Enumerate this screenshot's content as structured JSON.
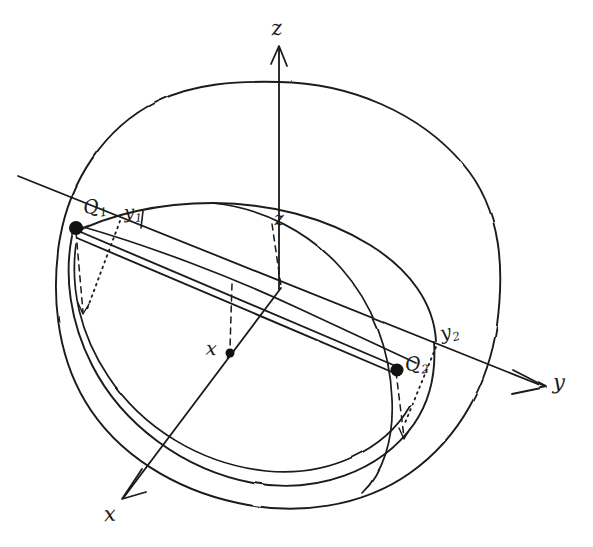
{
  "figure": {
    "kind": "hand-drawn-3d-sphere-diagram",
    "background_color": "#ffffff",
    "ink_color": "#1a1a1a"
  },
  "axes": [
    {
      "id": "z",
      "label": "z",
      "label_x": 271,
      "label_y": 18,
      "arrow": "up",
      "tip_x": 279,
      "tip_y": 47,
      "origin_x": 281,
      "origin_y": 288
    },
    {
      "id": "y",
      "label": "y",
      "label_x": 553,
      "label_y": 372,
      "arrow": "right",
      "tip_x": 545,
      "tip_y": 387,
      "origin_x": 281,
      "origin_y": 288
    },
    {
      "id": "x",
      "label": "x",
      "label_x": 104,
      "label_y": 504,
      "arrow": "down-left",
      "tip_x": 122,
      "tip_y": 500,
      "origin_x": 281,
      "origin_y": 288
    }
  ],
  "points": [
    {
      "id": "Q1",
      "base": "Q",
      "subscript": "1",
      "cx": 76,
      "cy": 228,
      "radius": 7,
      "label_x": 83,
      "label_y": 197
    },
    {
      "id": "Q2",
      "base": "Q",
      "subscript": "2",
      "cx": 397,
      "cy": 370,
      "radius": 6.5,
      "label_x": 405,
      "label_y": 354
    },
    {
      "id": "X",
      "base": "x",
      "subscript": "",
      "cx": 230,
      "cy": 353,
      "radius": 4.5,
      "label_x": 206,
      "label_y": 339
    }
  ],
  "inner_labels": [
    {
      "id": "y1",
      "base": "y",
      "subscript": "1",
      "label_x": 124,
      "label_y": 203
    },
    {
      "id": "y2",
      "base": "y",
      "subscript": "2",
      "label_x": 440,
      "label_y": 322
    },
    {
      "id": "z_inner",
      "base": "z",
      "subscript": "",
      "label_x": 274,
      "label_y": 209
    }
  ],
  "sphere": {
    "center_x": 279,
    "center_y": 290,
    "radius_x": 222,
    "radius_y": 208
  },
  "notes": {
    "band": "double parallel chord lines from Q1 to Q2 forming a narrow ribbon",
    "great_circle": "tilted ellipse through Q1 and Q2 representing a great circle of the sphere",
    "construction": "dashed projection lines and dotted angle markers at Q1, Q2 and the origin"
  }
}
